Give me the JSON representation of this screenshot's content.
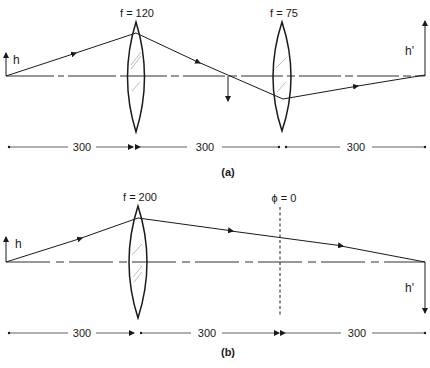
{
  "diagram_a": {
    "caption": "(a)",
    "object_label": "h",
    "image_label": "h'",
    "lens1": {
      "label": "f = 120",
      "focal_length": 120
    },
    "lens2": {
      "label": "f = 75",
      "focal_length": 75
    },
    "distances": [
      "300",
      "300",
      "300"
    ]
  },
  "diagram_b": {
    "caption": "(b)",
    "object_label": "h",
    "image_label": "h'",
    "lens": {
      "label": "f = 200",
      "focal_length": 200
    },
    "phase_plane_label": "ϕ = 0",
    "distances": [
      "300",
      "300",
      "300"
    ]
  },
  "colors": {
    "ink": "#1a1a1a",
    "background": "#ffffff",
    "lens_hatch": "#aaaaaa"
  }
}
